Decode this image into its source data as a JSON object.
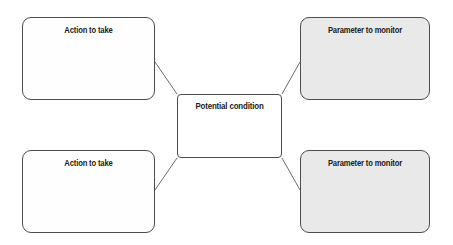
{
  "diagram": {
    "type": "concept-map",
    "background_color": "#ffffff",
    "center": {
      "label": "Potential condition",
      "fill_color": "#ffffff",
      "border_color": "#4d4d4d"
    },
    "nodes": [
      {
        "id": "action-top",
        "label": "Action to take",
        "position": "top-left",
        "fill_color": "#fefefe",
        "border_color": "#4d4d4d"
      },
      {
        "id": "param-top",
        "label": "Parameter to monitor",
        "position": "top-right",
        "fill_color": "#e9e9e9",
        "border_color": "#4d4d4d"
      },
      {
        "id": "action-bottom",
        "label": "Action to take",
        "position": "bottom-left",
        "fill_color": "#fefefe",
        "border_color": "#4d4d4d"
      },
      {
        "id": "param-bottom",
        "label": "Parameter to monitor",
        "position": "bottom-right",
        "fill_color": "#e9e9e9",
        "border_color": "#4d4d4d"
      }
    ],
    "connectors": [
      {
        "from": "center",
        "to": "action-top",
        "line_color": "#6e6e6e"
      },
      {
        "from": "center",
        "to": "param-top",
        "line_color": "#6e6e6e"
      },
      {
        "from": "center",
        "to": "action-bottom",
        "line_color": "#6e6e6e"
      },
      {
        "from": "center",
        "to": "param-bottom",
        "line_color": "#6e6e6e"
      }
    ]
  }
}
